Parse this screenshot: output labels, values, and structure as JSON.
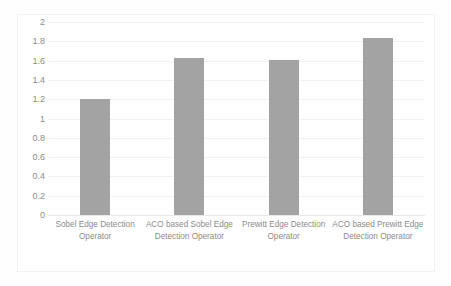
{
  "chart_data": {
    "type": "bar",
    "title": "",
    "subtitle": "",
    "xlabel": "",
    "ylabel": "",
    "ylim": [
      0,
      2
    ],
    "grid": true,
    "legend": false,
    "categories": [
      "Sobel Edge Detection Operator",
      "ACO based Sobel Edge Detection Operator",
      "Prewitt Edge Detection Operator",
      "ACO based Prewitt Edge Detection Operator"
    ],
    "values": [
      1.2,
      1.63,
      1.61,
      1.83
    ],
    "ytick_labels": [
      "2",
      "1.8",
      "1.6",
      "1.4",
      "1.2",
      "1",
      "0.8",
      "0.6",
      "0.4",
      "0.2",
      "0"
    ],
    "ytick_values": [
      2,
      1.8,
      1.6,
      1.4,
      1.2,
      1,
      0.8,
      0.6,
      0.4,
      0.2,
      0
    ],
    "bar_color": "#a3a3a3",
    "gridline_color": "#f1f1f1",
    "text_color": "#8c8c8c",
    "background_color": "#ffffff"
  }
}
